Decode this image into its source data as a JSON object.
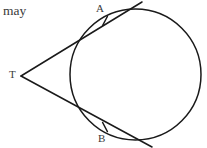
{
  "figure": {
    "caption": "may",
    "background_color": "#ffffff",
    "stroke_color": "#1a1a1a",
    "label_color": "#3a3a3a",
    "type": "geometry-diagram",
    "labels": {
      "point_a": "A",
      "point_b": "B",
      "point_t": "T"
    },
    "geometry": {
      "circle": {
        "cx": 135.5,
        "cy": 74.5,
        "r": 65.5,
        "stroke_width": 1.5
      },
      "external_point": {
        "x": 21,
        "y": 76
      },
      "tangent_point_a": {
        "x": 103.5,
        "y": 19.5
      },
      "tangent_point_b": {
        "x": 103.5,
        "y": 128.5
      },
      "tangent_ray_a_end": {
        "x": 142,
        "y": 2
      },
      "tangent_ray_b_end": {
        "x": 152,
        "y": 147
      },
      "tick_marks": [
        {
          "name": "tick-at-a",
          "cx": 105,
          "cy": 21,
          "angle_deg": 62
        },
        {
          "name": "tick-at-b",
          "cx": 105,
          "cy": 127,
          "angle_deg": -62
        }
      ]
    }
  }
}
